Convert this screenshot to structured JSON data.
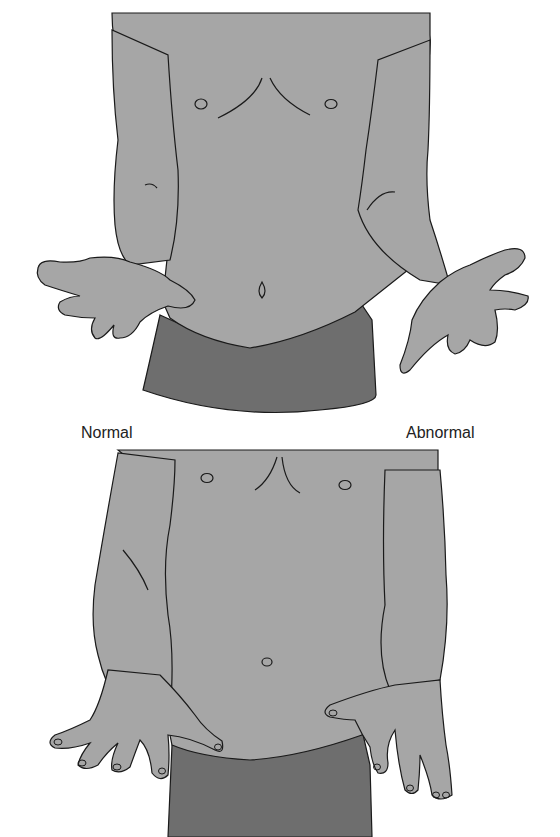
{
  "figure": {
    "panels": [
      {
        "id": "top",
        "description": "Torso with hands held out palms up in front of body"
      },
      {
        "id": "bottom",
        "description": "Torso with hands placed at the waistband, fingers spread"
      }
    ],
    "labels": {
      "normal": "Normal",
      "abnormal": "Abnormal"
    },
    "colors": {
      "skin": "#a6a6a6",
      "shorts": "#6e6e6e",
      "outline": "#1a1a1a",
      "background": "#ffffff"
    }
  }
}
